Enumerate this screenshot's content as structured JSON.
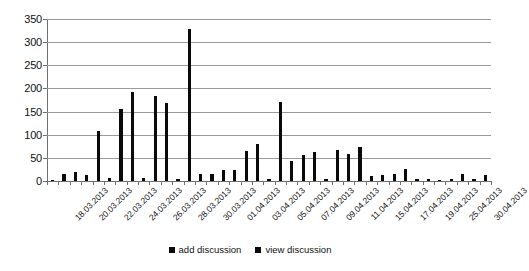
{
  "chart_data": {
    "type": "bar",
    "title": "",
    "xlabel": "",
    "ylabel": "",
    "ylim": [
      0,
      350
    ],
    "yticks": [
      0,
      50,
      100,
      150,
      200,
      250,
      300,
      350
    ],
    "ytick_labels": [
      "0",
      "50",
      "100",
      "150",
      "200",
      "250",
      "300",
      "350"
    ],
    "grid": true,
    "legend_position": "bottom",
    "categories": [
      "18.03.2013",
      "19.03.2013",
      "20.03.2013",
      "21.03.2013",
      "22.03.2013",
      "23.03.2013",
      "24.03.2013",
      "25.03.2013",
      "26.03.2013",
      "27.03.2013",
      "28.03.2013",
      "29.03.2013",
      "30.03.2013",
      "31.03.2013",
      "01.04.2013",
      "02.04.2013",
      "03.04.2013",
      "04.04.2013",
      "05.04.2013",
      "06.04.2013",
      "07.04.2013",
      "08.04.2013",
      "09.04.2013",
      "10.04.2013",
      "11.04.2013",
      "12.04.2013",
      "15.04.2013",
      "16.04.2013",
      "17.04.2013",
      "18.04.2013",
      "19.04.2013",
      "24.04.2013",
      "25.04.2013",
      "29.04.2013",
      "30.04.2013"
    ],
    "tick_labels": [
      "18.03.2013",
      "20.03.2013",
      "22.03.2013",
      "24.03.2013",
      "26.03.2013",
      "28.03.2013",
      "30.03.2013",
      "01.04.2013",
      "03.04.2013",
      "05.04.2013",
      "07.04.2013",
      "09.04.2013",
      "11.04.2013",
      "15.04.2013",
      "17.04.2013",
      "19.04.2013",
      "25.04.2013",
      "30.04.2013"
    ],
    "series": [
      {
        "name": "add discussion",
        "color": "#0a0a0a",
        "values": [
          2,
          0,
          0,
          0,
          0,
          0,
          7,
          0,
          6,
          0,
          4,
          0,
          0,
          0,
          0,
          0,
          0,
          0,
          5,
          0,
          0,
          0,
          4,
          0,
          0,
          0,
          0,
          0,
          0,
          0,
          0,
          0,
          0,
          0,
          0
        ]
      },
      {
        "name": "view discussion",
        "color": "#0a0a0a",
        "values": [
          0,
          16,
          19,
          13,
          108,
          156,
          192,
          183,
          168,
          328,
          0,
          15,
          16,
          24,
          24,
          64,
          81,
          170,
          44,
          57,
          62,
          66,
          58,
          74,
          10,
          14,
          15,
          25,
          4,
          5,
          3,
          4,
          16,
          4,
          14
        ]
      }
    ],
    "bar_heights": [
      2,
      16,
      19,
      13,
      108,
      7,
      156,
      192,
      6,
      183,
      168,
      4,
      328,
      15,
      16,
      24,
      24,
      64,
      81,
      5,
      170,
      44,
      57,
      62,
      4,
      66,
      58,
      74,
      10,
      14,
      15,
      25,
      4,
      5,
      3,
      4,
      16,
      4,
      14
    ]
  },
  "legend": {
    "items": [
      {
        "label": "add discussion",
        "color": "#0a0a0a",
        "swatch": "square-marker"
      },
      {
        "label": "view discussion",
        "color": "#0a0a0a",
        "swatch": "square-marker"
      }
    ]
  }
}
